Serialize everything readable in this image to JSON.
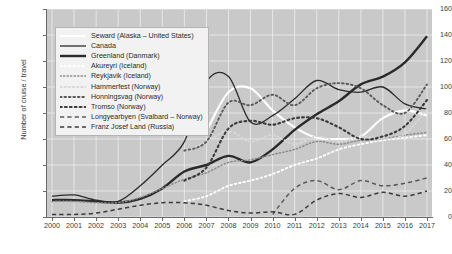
{
  "chart_data": {
    "type": "line",
    "title": "",
    "xlabel": "",
    "ylabel": "Number of cruise / travel",
    "xlim": [
      2000,
      2017
    ],
    "ylim": [
      0,
      160
    ],
    "grid": true,
    "legend_position": "top-left-inside",
    "categories": [
      2000,
      2001,
      2002,
      2003,
      2004,
      2005,
      2006,
      2007,
      2008,
      2009,
      2010,
      2011,
      2012,
      2013,
      2014,
      2015,
      2016,
      2017
    ],
    "xticks": [
      "2000",
      "2001",
      "2002",
      "2003",
      "2004",
      "2005",
      "2006",
      "2007",
      "2008",
      "2009",
      "2010",
      "2011",
      "2012",
      "2013",
      "2014",
      "2015",
      "2016",
      "2017"
    ],
    "yticks": [
      "0",
      "20",
      "40",
      "60",
      "80",
      "100",
      "120",
      "140",
      "160"
    ],
    "series": [
      {
        "name": "Seward (Alaska – United States)",
        "color": "#ffffff",
        "style": "solid",
        "width": 2.1,
        "values": [
          null,
          null,
          null,
          null,
          null,
          null,
          null,
          66,
          96,
          99,
          82,
          69,
          61,
          60,
          62,
          76,
          82,
          78
        ]
      },
      {
        "name": "Canada",
        "color": "#2a2a2a",
        "style": "solid",
        "width": 1.3,
        "values": [
          16,
          17,
          13,
          12,
          24,
          40,
          58,
          104,
          108,
          73,
          78,
          91,
          105,
          98,
          96,
          100,
          87,
          83
        ]
      },
      {
        "name": "Greenland (Danmark)",
        "color": "#2a2a2a",
        "style": "solid",
        "width": 2.4,
        "values": [
          13,
          13,
          12,
          11,
          14,
          22,
          35,
          40,
          47,
          42,
          52,
          67,
          79,
          89,
          102,
          108,
          119,
          139
        ]
      },
      {
        "name": "Akureyri (Iceland)",
        "color": "#ffffff",
        "style": "dotted",
        "width": 1.9,
        "values": [
          null,
          null,
          null,
          null,
          null,
          null,
          12,
          16,
          24,
          28,
          33,
          40,
          45,
          52,
          56,
          59,
          61,
          63
        ]
      },
      {
        "name": "Reykjavik (Iceland)",
        "color": "#8c8c8c",
        "style": "dotted",
        "width": 1.5,
        "values": [
          12,
          12,
          11,
          11,
          15,
          22,
          29,
          34,
          42,
          44,
          48,
          52,
          58,
          56,
          59,
          60,
          63,
          65
        ]
      },
      {
        "name": "Hammerfest (Norway)",
        "color": "#d8d8d8",
        "style": "dotted",
        "width": 1.8,
        "values": [
          null,
          null,
          null,
          null,
          null,
          null,
          50,
          58,
          66,
          58,
          63,
          56,
          62,
          58,
          62,
          60,
          64,
          83
        ]
      },
      {
        "name": "Honningsvag (Norway)",
        "color": "#5a5a5a",
        "style": "dotted",
        "width": 1.9,
        "values": [
          null,
          null,
          null,
          null,
          null,
          null,
          51,
          58,
          88,
          86,
          94,
          86,
          99,
          103,
          99,
          86,
          80,
          102
        ]
      },
      {
        "name": "Tromso (Norway)",
        "color": "#3a3a3a",
        "style": "dotted",
        "width": 2.1,
        "values": [
          null,
          null,
          null,
          null,
          null,
          null,
          28,
          38,
          68,
          74,
          71,
          76,
          76,
          69,
          60,
          62,
          70,
          90
        ]
      },
      {
        "name": "Longyearbyen (Svalbard – Norway)",
        "color": "#5a5a5a",
        "style": "dashed",
        "width": 1.5,
        "values": [
          null,
          null,
          null,
          null,
          null,
          null,
          null,
          null,
          null,
          null,
          2,
          22,
          28,
          21,
          28,
          24,
          26,
          30
        ]
      },
      {
        "name": "Franz Josef Land (Russia)",
        "color": "#3a3a3a",
        "style": "dashed",
        "width": 1.5,
        "values": [
          2,
          2,
          3,
          6,
          9,
          11,
          11,
          9,
          5,
          3,
          4,
          2,
          13,
          18,
          15,
          19,
          16,
          20
        ]
      }
    ]
  },
  "source_note": "Cercle / Department of Geography - Lund University, 2019"
}
